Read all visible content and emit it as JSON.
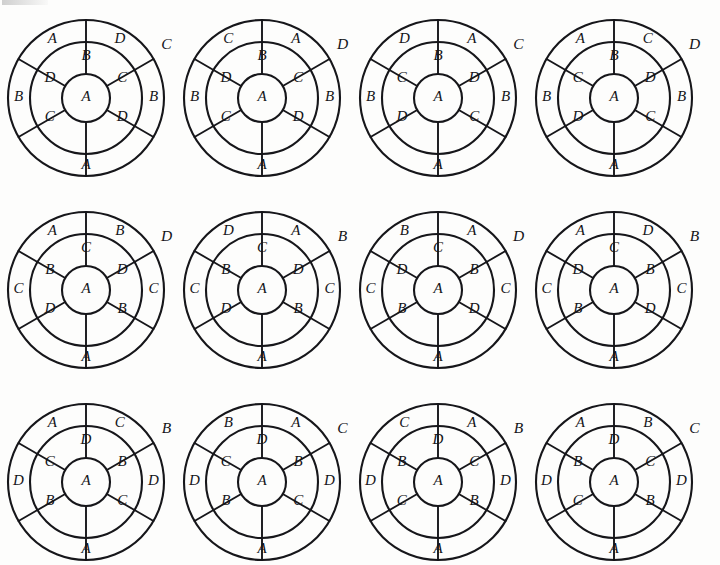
{
  "figure": {
    "type": "diagram-grid",
    "rows": 3,
    "columns": 4,
    "letters": [
      "A",
      "B",
      "C",
      "D"
    ],
    "stroke_color": "#16161a",
    "background_color": "#fdfdfc"
  },
  "diagram_geometry": {
    "outer_radius": 78,
    "mid_radius": 56,
    "inner_ring_outer_radius": 56,
    "hub_radius": 24,
    "outer_ring_divider_angles_deg": [
      90,
      30,
      330,
      270,
      210,
      150
    ],
    "inner_ring_divider_angles_deg": [
      90,
      30,
      330,
      270,
      210,
      150
    ],
    "outer_label_angles_deg": [
      120,
      60,
      180,
      0,
      240,
      300
    ],
    "inner_label_angles_deg": [
      90,
      150,
      30,
      210,
      330,
      270
    ]
  },
  "wheels": [
    {
      "id": "wheel-1",
      "row": 1,
      "column": 1,
      "outside_label": "C",
      "outer_ring": {
        "upper_left": "A",
        "upper_right": "D",
        "lower_left": "B",
        "lower_right": "B",
        "bottom": "A"
      },
      "inner_ring": {
        "top": "B",
        "left": "D",
        "right": "C",
        "lower_left": "C",
        "lower_right": "D"
      },
      "hub": "A"
    },
    {
      "id": "wheel-2",
      "row": 1,
      "column": 2,
      "outside_label": "D",
      "outer_ring": {
        "upper_left": "C",
        "upper_right": "A",
        "lower_left": "B",
        "lower_right": "B",
        "bottom": "A"
      },
      "inner_ring": {
        "top": "B",
        "left": "D",
        "right": "C",
        "lower_left": "C",
        "lower_right": "D"
      },
      "hub": "A"
    },
    {
      "id": "wheel-3",
      "row": 1,
      "column": 3,
      "outside_label": "C",
      "outer_ring": {
        "upper_left": "D",
        "upper_right": "A",
        "lower_left": "B",
        "lower_right": "B",
        "bottom": "A"
      },
      "inner_ring": {
        "top": "B",
        "left": "C",
        "right": "D",
        "lower_left": "D",
        "lower_right": "C"
      },
      "hub": "A"
    },
    {
      "id": "wheel-4",
      "row": 1,
      "column": 4,
      "outside_label": "D",
      "outer_ring": {
        "upper_left": "A",
        "upper_right": "C",
        "lower_left": "B",
        "lower_right": "B",
        "bottom": "A"
      },
      "inner_ring": {
        "top": "B",
        "left": "C",
        "right": "D",
        "lower_left": "D",
        "lower_right": "C"
      },
      "hub": "A"
    },
    {
      "id": "wheel-5",
      "row": 2,
      "column": 1,
      "outside_label": "D",
      "outer_ring": {
        "upper_left": "A",
        "upper_right": "B",
        "lower_left": "C",
        "lower_right": "C",
        "bottom": "A"
      },
      "inner_ring": {
        "top": "C",
        "left": "B",
        "right": "D",
        "lower_left": "D",
        "lower_right": "B"
      },
      "hub": "A"
    },
    {
      "id": "wheel-6",
      "row": 2,
      "column": 2,
      "outside_label": "B",
      "outer_ring": {
        "upper_left": "D",
        "upper_right": "A",
        "lower_left": "C",
        "lower_right": "C",
        "bottom": "A"
      },
      "inner_ring": {
        "top": "C",
        "left": "B",
        "right": "D",
        "lower_left": "D",
        "lower_right": "B"
      },
      "hub": "A"
    },
    {
      "id": "wheel-7",
      "row": 2,
      "column": 3,
      "outside_label": "D",
      "outer_ring": {
        "upper_left": "B",
        "upper_right": "A",
        "lower_left": "C",
        "lower_right": "C",
        "bottom": "A"
      },
      "inner_ring": {
        "top": "C",
        "left": "D",
        "right": "B",
        "lower_left": "B",
        "lower_right": "D"
      },
      "hub": "A"
    },
    {
      "id": "wheel-8",
      "row": 2,
      "column": 4,
      "outside_label": "B",
      "outer_ring": {
        "upper_left": "A",
        "upper_right": "D",
        "lower_left": "C",
        "lower_right": "C",
        "bottom": "A"
      },
      "inner_ring": {
        "top": "C",
        "left": "D",
        "right": "B",
        "lower_left": "B",
        "lower_right": "D"
      },
      "hub": "A"
    },
    {
      "id": "wheel-9",
      "row": 3,
      "column": 1,
      "outside_label": "B",
      "outer_ring": {
        "upper_left": "A",
        "upper_right": "C",
        "lower_left": "D",
        "lower_right": "D",
        "bottom": "A"
      },
      "inner_ring": {
        "top": "D",
        "left": "C",
        "right": "B",
        "lower_left": "B",
        "lower_right": "C"
      },
      "hub": "A"
    },
    {
      "id": "wheel-10",
      "row": 3,
      "column": 2,
      "outside_label": "C",
      "outer_ring": {
        "upper_left": "B",
        "upper_right": "A",
        "lower_left": "D",
        "lower_right": "D",
        "bottom": "A"
      },
      "inner_ring": {
        "top": "D",
        "left": "C",
        "right": "B",
        "lower_left": "B",
        "lower_right": "C"
      },
      "hub": "A"
    },
    {
      "id": "wheel-11",
      "row": 3,
      "column": 3,
      "outside_label": "B",
      "outer_ring": {
        "upper_left": "C",
        "upper_right": "A",
        "lower_left": "D",
        "lower_right": "D",
        "bottom": "A"
      },
      "inner_ring": {
        "top": "D",
        "left": "B",
        "right": "C",
        "lower_left": "C",
        "lower_right": "B"
      },
      "hub": "A"
    },
    {
      "id": "wheel-12",
      "row": 3,
      "column": 4,
      "outside_label": "C",
      "outer_ring": {
        "upper_left": "A",
        "upper_right": "B",
        "lower_left": "D",
        "lower_right": "D",
        "bottom": "A"
      },
      "inner_ring": {
        "top": "D",
        "left": "B",
        "right": "C",
        "lower_left": "C",
        "lower_right": "B"
      },
      "hub": "A"
    }
  ]
}
